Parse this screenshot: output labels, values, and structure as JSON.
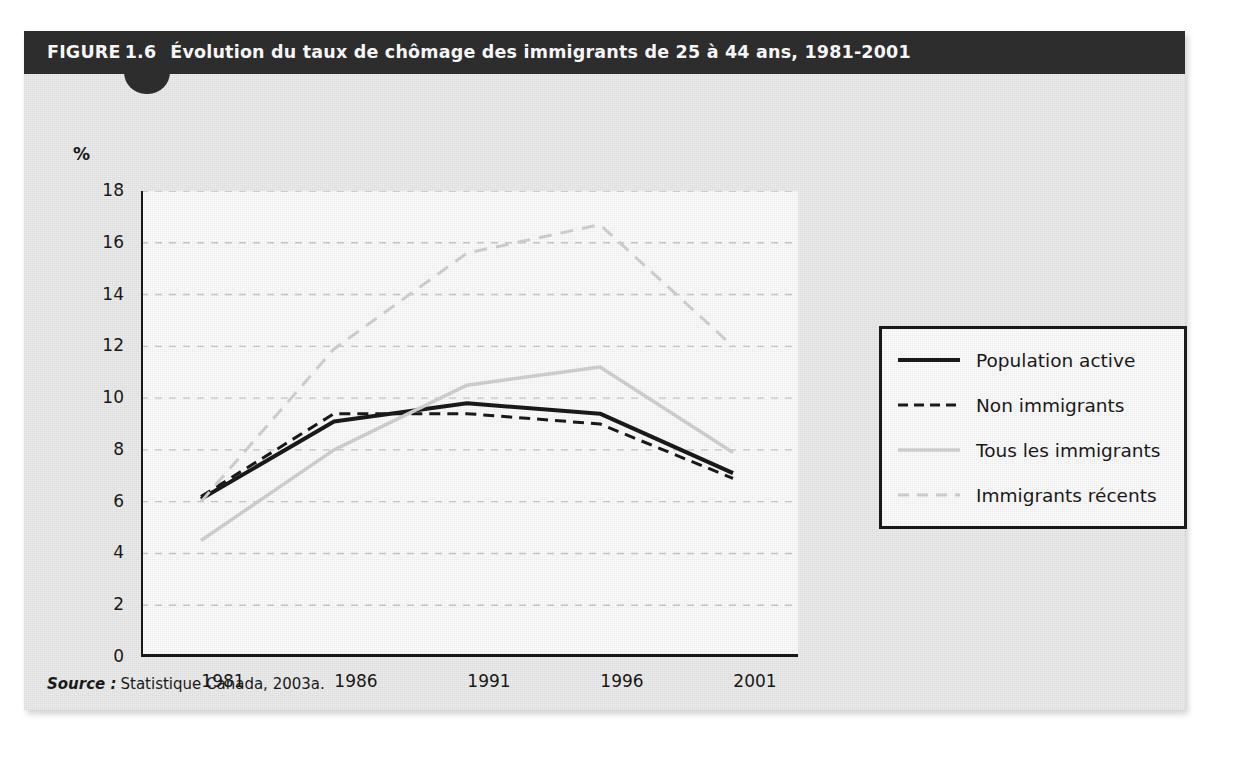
{
  "figure": {
    "label": "FIGURE",
    "number": "1.6",
    "title": "Évolution du taux de chômage des immigrants de 25 à 44 ans, 1981-2001",
    "source_key": "Source :",
    "source_text": "Statistique Canada, 2003a."
  },
  "colors": {
    "header_bg": "#2e2e2e",
    "card_bg": "#ececec",
    "plot_bg": "#fdfdfd",
    "dark_series": "#1a1a1a",
    "light_series": "#d2d2d2",
    "gridline": "#c9c9c9",
    "axis": "#1a1a1a"
  },
  "legend": {
    "items": [
      {
        "label": "Population active",
        "style": "solid",
        "color": "#1a1a1a",
        "width": 4
      },
      {
        "label": "Non immigrants",
        "style": "dashed",
        "color": "#1a1a1a",
        "width": 3
      },
      {
        "label": "Tous les immigrants",
        "style": "solid",
        "color": "#d2d2d2",
        "width": 3.5
      },
      {
        "label": "Immigrants récents",
        "style": "dashed",
        "color": "#d2d2d2",
        "width": 3
      }
    ]
  },
  "chart_data": {
    "type": "line",
    "title": "Évolution du taux de chômage des immigrants de 25 à 44 ans, 1981-2001",
    "xlabel": "",
    "ylabel": "%",
    "x": [
      1981,
      1986,
      1991,
      1996,
      2001
    ],
    "categories": [
      "1981",
      "1986",
      "1991",
      "1996",
      "2001"
    ],
    "xtick_labels": [
      "1981",
      "1986",
      "1991",
      "1996",
      "2001"
    ],
    "ytick_labels": [
      "0",
      "2",
      "4",
      "6",
      "8",
      "10",
      "12",
      "14",
      "16",
      "18"
    ],
    "yticks": [
      0,
      2,
      4,
      6,
      8,
      10,
      12,
      14,
      16,
      18
    ],
    "ylim": [
      0,
      18
    ],
    "grid": "horizontal-dashed",
    "legend_position": "right-outside",
    "series": [
      {
        "name": "Population active",
        "values": [
          6.1,
          9.1,
          9.8,
          9.4,
          7.1
        ],
        "style": "solid",
        "color": "#1a1a1a",
        "width": 4
      },
      {
        "name": "Non immigrants",
        "values": [
          6.2,
          9.4,
          9.4,
          9.0,
          6.9
        ],
        "style": "dashed",
        "color": "#1a1a1a",
        "width": 3
      },
      {
        "name": "Tous les immigrants",
        "values": [
          4.5,
          8.0,
          10.5,
          11.2,
          7.9
        ],
        "style": "solid",
        "color": "#d2d2d2",
        "width": 3.5
      },
      {
        "name": "Immigrants récents",
        "values": [
          6.0,
          11.9,
          15.6,
          16.7,
          12.0
        ],
        "style": "dashed",
        "color": "#d2d2d2",
        "width": 3
      }
    ]
  }
}
